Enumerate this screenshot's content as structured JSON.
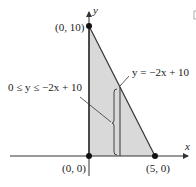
{
  "diagram": {
    "axis_labels": {
      "x": "x",
      "y": "y"
    },
    "points": [
      {
        "name": "origin",
        "label": "(0, 0)",
        "x": 0,
        "y": 0
      },
      {
        "name": "y-intercept",
        "label": "(0, 10)",
        "x": 0,
        "y": 10
      },
      {
        "name": "x-intercept",
        "label": "(5, 0)",
        "x": 5,
        "y": 0
      }
    ],
    "line_label": "y = −2x + 10",
    "region_label": "0 ≤ y ≤ −2x + 10",
    "strip_x": 1.8,
    "colors": {
      "region_fill": "#d9d9d9",
      "line": "#333333"
    }
  }
}
